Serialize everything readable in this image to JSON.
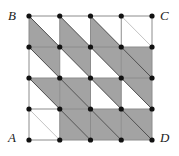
{
  "figure": {
    "kind": "geometry-diagram",
    "grid": {
      "rows": 4,
      "cols": 4,
      "node_rows": 5,
      "node_cols": 5,
      "x_left": 29,
      "x_right": 152,
      "y_top": 16,
      "y_bottom": 140,
      "cell_width": 30.75,
      "cell_height": 31.0
    },
    "colors": {
      "background": "#ffffff",
      "shade_fill": "#a3a3a3",
      "grid_line": "#8c8c8c",
      "diagonal_line": "#4d4d4d",
      "node_fill": "#111111",
      "label_text": "#1a1a1a"
    },
    "style": {
      "node_radius": 2.6,
      "grid_line_width": 1.0,
      "diagonal_line_width": 1.0,
      "shade_opacity": 1
    },
    "corner_labels": [
      {
        "id": "A",
        "text": "A",
        "position": "bottom-left"
      },
      {
        "id": "B",
        "text": "B",
        "position": "top-left"
      },
      {
        "id": "C",
        "text": "C",
        "position": "top-right"
      },
      {
        "id": "D",
        "text": "D",
        "position": "bottom-right"
      }
    ],
    "cell_shading_legend": {
      "L": "lower-left triangle shaded",
      "U": "upper-right triangle shaded",
      "F": "entire cell shaded (both triangles)",
      "N": "cell not shaded"
    },
    "cell_shading": [
      [
        "L",
        "L",
        "L",
        "N"
      ],
      [
        "U",
        "U",
        "U",
        "F"
      ],
      [
        "U",
        "F",
        "U",
        "U"
      ],
      [
        "N",
        "F",
        "F",
        "F"
      ]
    ],
    "diagonal_direction": "NW-SE in every cell"
  }
}
